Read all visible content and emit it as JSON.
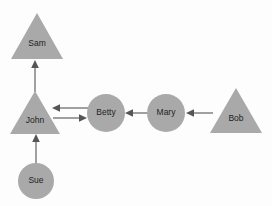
{
  "diagram": {
    "background_color": "#fdfdfd",
    "node_fill_color": "#a9a9a9",
    "edge_color": "#555555",
    "label_color": "#222222",
    "nodes": [
      {
        "id": "sam",
        "label": "Sam",
        "shape": "triangle",
        "cx": 37,
        "cy": 36,
        "w": 52,
        "h": 46
      },
      {
        "id": "john",
        "label": "John",
        "shape": "triangle",
        "cx": 35,
        "cy": 113,
        "w": 50,
        "h": 44
      },
      {
        "id": "sue",
        "label": "Sue",
        "shape": "circle",
        "cx": 36,
        "cy": 181,
        "r": 18
      },
      {
        "id": "betty",
        "label": "Betty",
        "shape": "circle",
        "cx": 106,
        "cy": 113,
        "r": 19
      },
      {
        "id": "mary",
        "label": "Mary",
        "shape": "circle",
        "cx": 166,
        "cy": 113,
        "r": 19
      },
      {
        "id": "bob",
        "label": "Bob",
        "shape": "triangle",
        "cx": 236,
        "cy": 111,
        "w": 52,
        "h": 46
      }
    ],
    "edges": [
      {
        "id": "john-sam",
        "from": "john",
        "to": "sam",
        "x1": 35,
        "y1": 92,
        "x2": 35,
        "y2": 62,
        "direction": "up"
      },
      {
        "id": "sue-john",
        "from": "sue",
        "to": "john",
        "x1": 36,
        "y1": 162,
        "x2": 36,
        "y2": 136,
        "direction": "up"
      },
      {
        "id": "betty-john",
        "from": "betty",
        "to": "john",
        "x1": 86,
        "y1": 108,
        "x2": 53,
        "y2": 108,
        "direction": "left"
      },
      {
        "id": "john-betty",
        "from": "john",
        "to": "betty",
        "x1": 53,
        "y1": 118,
        "x2": 86,
        "y2": 118,
        "direction": "right"
      },
      {
        "id": "mary-betty",
        "from": "mary",
        "to": "betty",
        "x1": 146,
        "y1": 113,
        "x2": 126,
        "y2": 113,
        "direction": "left"
      },
      {
        "id": "bob-mary",
        "from": "bob",
        "to": "mary",
        "x1": 212,
        "y1": 113,
        "x2": 187,
        "y2": 113,
        "direction": "left"
      }
    ]
  }
}
